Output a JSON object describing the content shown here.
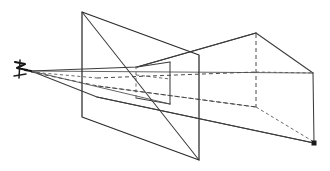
{
  "figure": {
    "domain_note": "line diagram",
    "background_color": "#ffffff",
    "stroke_color": "#3c3c3c",
    "hidden_stroke_color": "#4a4a4a",
    "vanishing_point_color": "#1a1a1a",
    "labels": {
      "eye_icon": "eye-viewpoint-icon",
      "center_of_projection": "",
      "picture_plane": "",
      "vanishing_point": ""
    },
    "elements": [
      {
        "name": "eye-point",
        "kind": "marker",
        "x": 22,
        "y": 71
      },
      {
        "name": "picture-plane",
        "kind": "parallelogram"
      },
      {
        "name": "projected-image-quad",
        "kind": "quad"
      },
      {
        "name": "object-box",
        "kind": "box"
      },
      {
        "name": "projection-rays",
        "kind": "lines",
        "count": 4
      },
      {
        "name": "vanishing-point",
        "kind": "dot",
        "x": 316,
        "y": 144
      }
    ],
    "geometry": {
      "eye": {
        "x": 31,
        "y": 71
      },
      "picture_plane": [
        {
          "x": 82,
          "y": 12
        },
        {
          "x": 199,
          "y": 55
        },
        {
          "x": 199,
          "y": 160
        },
        {
          "x": 82,
          "y": 117
        }
      ],
      "projected_quad": [
        {
          "x": 136,
          "y": 68
        },
        {
          "x": 170,
          "y": 62
        },
        {
          "x": 170,
          "y": 105
        },
        {
          "x": 136,
          "y": 98
        }
      ],
      "box_front_top_left": {
        "x": 136,
        "y": 68
      },
      "box_top_apex": {
        "x": 256,
        "y": 33
      },
      "box_right_top": {
        "x": 313,
        "y": 73
      },
      "box_right_bottom": {
        "x": 314,
        "y": 143
      },
      "vanishing_point": {
        "x": 316,
        "y": 144
      },
      "horizon_left": {
        "x": 31,
        "y": 71
      },
      "horizon_right": {
        "x": 313,
        "y": 73
      }
    }
  }
}
